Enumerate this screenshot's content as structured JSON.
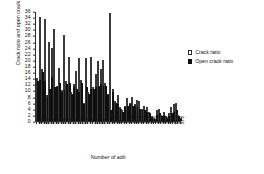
{
  "chart_data": {
    "type": "bar",
    "title": "",
    "subtitle": "",
    "xlabel": "Number of adit",
    "ylabel": "Crack ratio and open crack ratio",
    "ylim": [
      0,
      36
    ],
    "ytick_step": 2,
    "yticks": [
      0,
      2,
      4,
      6,
      8,
      10,
      12,
      14,
      16,
      18,
      20,
      22,
      24,
      26,
      28,
      30,
      32,
      34,
      36
    ],
    "grid": false,
    "legend_position": "right",
    "legend": [
      "Crack ratio",
      "Open crack ratio"
    ],
    "bar_style": "overlapping",
    "colors": {
      "crack_ratio": "#ffffff",
      "crack_ratio_edge": "#3a3a3a",
      "open_crack_ratio": "#101010",
      "axis": "#2b2b2b",
      "text": "#111111"
    },
    "categories": [
      "1-1",
      "1-2",
      "2-1",
      "2-2",
      "2-3",
      "2-4",
      "3-1",
      "3-2",
      "3-3",
      "4-1",
      "4-2",
      "4-3",
      "4-4",
      "5-1",
      "5-2",
      "5-3",
      "6-1",
      "6-2",
      "6-3",
      "6-4",
      "7-1",
      "7-2",
      "7-3",
      "8-1",
      "8-2",
      "8-3",
      "8-4",
      "9-1",
      "9-2",
      "9-3",
      "10-1",
      "10-2",
      "10-3",
      "11-1",
      "11-2",
      "11-3",
      "12-1",
      "12-2",
      "12-3",
      "13-1",
      "13-2",
      "13-3",
      "14-1",
      "14-2",
      "14-3",
      "15-1",
      "15-2",
      "16-1",
      "16-2",
      "17-1",
      "17-2",
      "18-1",
      "18-2",
      "19-1",
      "19-2",
      "20-1",
      "20-2",
      "21-1",
      "21-2",
      "22-1"
    ],
    "series": [
      {
        "name": "Crack ratio",
        "values": [
          14.0,
          34.0,
          17.0,
          33.5,
          8.5,
          26.0,
          24.0,
          30.0,
          11.5,
          17.5,
          10.0,
          28.0,
          13.0,
          21.0,
          9.5,
          12.0,
          16.5,
          20.5,
          13.5,
          6.0,
          20.5,
          9.5,
          21.0,
          11.0,
          15.5,
          19.5,
          17.0,
          20.0,
          12.5,
          9.0,
          35.5,
          10.5,
          6.5,
          8.5,
          4.5,
          3.5,
          5.0,
          7.5,
          6.0,
          8.0,
          5.5,
          7.0,
          6.5,
          4.0,
          5.0,
          4.5,
          3.0,
          1.5,
          1.0,
          3.5,
          4.0,
          2.0,
          3.0,
          1.5,
          2.5,
          4.5,
          5.5,
          6.0,
          2.0,
          1.0
        ]
      },
      {
        "name": "Open crack ratio",
        "values": [
          13.0,
          13.5,
          16.0,
          13.0,
          8.0,
          10.5,
          14.5,
          11.0,
          11.0,
          12.5,
          9.5,
          10.0,
          12.0,
          12.5,
          9.0,
          11.0,
          10.5,
          9.5,
          12.5,
          5.5,
          11.0,
          9.0,
          10.5,
          10.5,
          11.0,
          11.5,
          12.0,
          11.5,
          11.5,
          8.5,
          3.5,
          9.5,
          6.0,
          5.5,
          4.0,
          3.0,
          4.5,
          5.0,
          5.5,
          5.0,
          5.0,
          4.5,
          4.0,
          3.5,
          3.5,
          3.0,
          2.5,
          1.0,
          0.5,
          2.0,
          2.5,
          1.5,
          2.0,
          1.0,
          1.5,
          2.5,
          3.0,
          3.5,
          1.5,
          0.5
        ]
      }
    ]
  }
}
